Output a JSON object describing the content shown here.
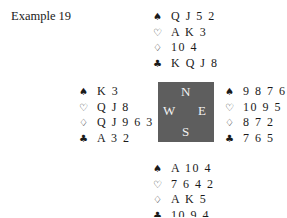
{
  "title": "Example 19",
  "suits": {
    "spades": "♠",
    "hearts": "♡",
    "diamonds": "♢",
    "clubs": "♣"
  },
  "compass": {
    "north": "N",
    "west": "W",
    "east": "E",
    "south": "S",
    "background_color": "#5e5e5e"
  },
  "hands": {
    "north": {
      "spades": "Q J 5 2",
      "hearts": "A K 3",
      "diamonds": "10 4",
      "clubs": "K Q J 8"
    },
    "west": {
      "spades": "K 3",
      "hearts": "Q J 8",
      "diamonds": "Q J 9 6 3",
      "clubs": "A 3 2"
    },
    "east": {
      "spades": "9 8 7 6",
      "hearts": "10 9 5",
      "diamonds": "8 7 2",
      "clubs": "7 6 5"
    },
    "south": {
      "spades": "A 10 4",
      "hearts": "7 6 4 2",
      "diamonds": "A K 5",
      "clubs": "10 9 4"
    }
  }
}
